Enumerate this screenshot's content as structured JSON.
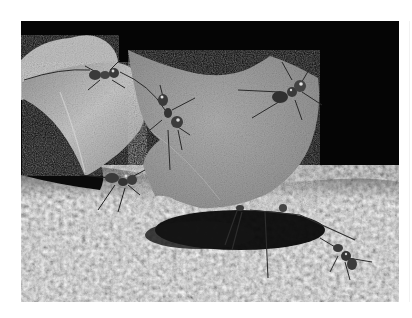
{
  "image": {
    "description": "Black-and-white photograph of leaf-cutter ants carrying cut leaf fragments across a bark surface at night",
    "frame": {
      "x": 21,
      "y": 21,
      "width": 378,
      "height": 281
    },
    "background_color": "#ffffff",
    "palette": {
      "sky": "#050505",
      "leaf_large": "#a6a6a6",
      "leaf_left": "#b8b8b8",
      "leaf_back": "#c4c4c4",
      "ground_light": "#b3b3b3",
      "ground_dark": "#6e6e6e",
      "shadow": "#0c0c0c",
      "ant_body": "#3a3a3a",
      "ant_highlight": "#d8d8d8"
    }
  },
  "scene": {
    "subjects": [
      {
        "name": "large-leaf-fragment",
        "shape": "crescent-topped semicircle",
        "center": [
          215,
          135
        ]
      },
      {
        "name": "left-leaf-fragment",
        "shape": "folded triangular leaf",
        "center": [
          90,
          110
        ]
      },
      {
        "name": "back-leaf-fragment",
        "shape": "pale leaf edge top-left",
        "center": [
          65,
          55
        ]
      }
    ],
    "ants": [
      {
        "name": "ant-top-left",
        "x": 105,
        "y": 75
      },
      {
        "name": "ant-center",
        "x": 170,
        "y": 120
      },
      {
        "name": "ant-top-right",
        "x": 290,
        "y": 95
      },
      {
        "name": "ant-lower-left",
        "x": 120,
        "y": 180
      },
      {
        "name": "ant-carrier-under-leaf",
        "x": 240,
        "y": 220
      },
      {
        "name": "ant-lower-right",
        "x": 345,
        "y": 255
      }
    ],
    "ground": {
      "horizon_y_left": 170,
      "horizon_y_right": 185
    }
  }
}
